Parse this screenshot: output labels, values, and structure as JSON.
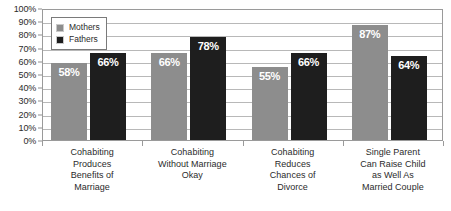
{
  "chart_data": {
    "type": "bar",
    "title": "",
    "subtitle": "",
    "xlabel": "",
    "ylabel": "",
    "ylim": [
      0,
      100
    ],
    "y_ticks": [
      "0%",
      "10%",
      "20%",
      "30%",
      "40%",
      "50%",
      "60%",
      "70%",
      "80%",
      "90%",
      "100%"
    ],
    "y_tick_values": [
      0,
      10,
      20,
      30,
      40,
      50,
      60,
      70,
      80,
      90,
      100
    ],
    "grid": true,
    "legend_position": "top-left-inside",
    "value_suffix": "%",
    "categories": [
      "Cohabiting Produces Benefits of Marriage",
      "Cohabiting Without Marriage Okay",
      "Cohabiting Reduces Chances of Divorce",
      "Single Parent Can Raise Child as Well As Married Couple"
    ],
    "category_lines": [
      [
        "Cohabiting",
        "Produces",
        "Benefits of",
        "Marriage"
      ],
      [
        "Cohabiting",
        "Without Marriage",
        "Okay"
      ],
      [
        "Cohabiting",
        "Reduces",
        "Chances of",
        "Divorce"
      ],
      [
        "Single Parent",
        "Can Raise Child",
        "as Well As",
        "Married Couple"
      ]
    ],
    "series": [
      {
        "name": "Mothers",
        "color": "#8d8d8d",
        "values": [
          58,
          66,
          55,
          87
        ],
        "labels": [
          "58%",
          "66%",
          "55%",
          "87%"
        ]
      },
      {
        "name": "Fathers",
        "color": "#1e1e1e",
        "values": [
          66,
          78,
          66,
          64
        ],
        "labels": [
          "66%",
          "78%",
          "66%",
          "64%"
        ]
      }
    ]
  },
  "legend": {
    "items": [
      {
        "label": "Mothers",
        "color": "#8d8d8d"
      },
      {
        "label": "Fathers",
        "color": "#1e1e1e"
      }
    ]
  },
  "colors": {
    "mothers": "#8d8d8d",
    "fathers": "#1e1e1e",
    "gridline": "#b8b8b8",
    "axis": "#9a9a9a",
    "text": "#2b2b2b",
    "label_text": "#ffffff",
    "background": "#ffffff"
  }
}
